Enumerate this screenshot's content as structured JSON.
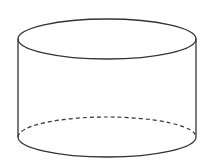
{
  "diagram": {
    "shape": "cylinder",
    "stroke_color": "#333333",
    "background": "#ffffff",
    "top_ellipse": {
      "cx": 107,
      "cy": 39,
      "rx": 89,
      "ry": 20
    },
    "bottom_ellipse": {
      "cx": 107,
      "cy": 137,
      "rx": 89,
      "ry": 20
    },
    "hidden_edge_style": "dashed"
  }
}
